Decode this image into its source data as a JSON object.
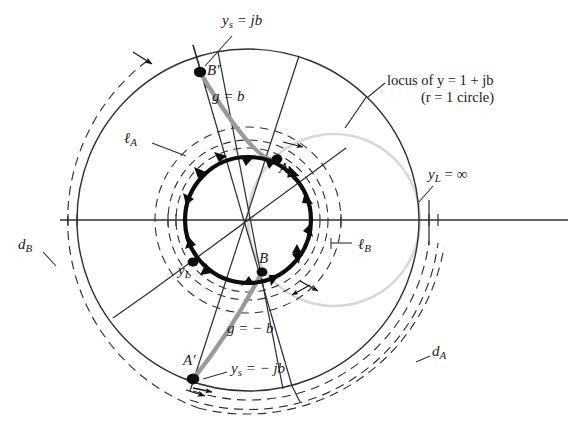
{
  "figure": {
    "type": "smith-chart-diagram",
    "background": "#ffffff",
    "ink": "#2b2b2b",
    "bold_ink": "#0d0d0d",
    "gray_trace": "#8c8c8c",
    "light_gray": "#d5d5d5"
  },
  "labels": {
    "ys_pos": {
      "text": "ys = jb",
      "main": "y",
      "sub": "s",
      "rest": " = jb",
      "x": 222,
      "y": 20
    },
    "ys_neg": {
      "text": "ys = − jb",
      "main": "y",
      "sub": "s",
      "rest": " = − jb",
      "x": 232,
      "y": 366
    },
    "b_prime": {
      "text": "B′",
      "x": 207,
      "y": 64
    },
    "a_prime": {
      "text": "A′",
      "x": 185,
      "y": 356
    },
    "point_a": {
      "text": "A",
      "x": 279,
      "y": 165
    },
    "point_b": {
      "text": "B",
      "x": 260,
      "y": 257
    },
    "g_eq_b": {
      "text": "g = b",
      "x": 212,
      "y": 90
    },
    "g_eq_neg_b": {
      "text": "g = − b",
      "x": 229,
      "y": 323
    },
    "ell_a": {
      "text": "ℓA",
      "main": "ℓ",
      "sub": "A",
      "x": 127,
      "y": 136
    },
    "ell_b": {
      "text": "ℓB",
      "main": "ℓ",
      "sub": "B",
      "x": 355,
      "y": 242
    },
    "d_a": {
      "text": "dA",
      "main": "d",
      "sub": "A",
      "x": 434,
      "y": 349
    },
    "d_b": {
      "text": "dB",
      "main": "d",
      "sub": "B",
      "x": 19,
      "y": 242
    },
    "y_l": {
      "text": "yL",
      "main": "y",
      "sub": "L",
      "x": 180,
      "y": 266
    },
    "y_l_inf": {
      "text": "yL = ∞",
      "main": "y",
      "sub": "L",
      "rest": " = ∞",
      "x": 430,
      "y": 172
    },
    "locus": {
      "line1": "locus of y = 1 + jb",
      "line2": "(r = 1  circle)",
      "x": 387,
      "y": 80
    }
  },
  "geometry": {
    "center": {
      "x": 248,
      "y": 220
    },
    "outer_solid_radius": 171,
    "dashed_da_radius": 181,
    "dashed_da2_radius": 190,
    "dashed_db_radius": 200,
    "bold_circle_radius": 63,
    "dashed_la_radius": 72,
    "dashed_la2_radius": 80,
    "dashed_lb_radius": 93,
    "r1_circle_radius": 86,
    "r1_circle_offset_x": 86
  },
  "markers": {
    "b_prime": {
      "x": 200,
      "y": 72
    },
    "a_prime": {
      "x": 193,
      "y": 379
    },
    "point_a": {
      "x": 277,
      "y": 159
    },
    "point_b": {
      "x": 262,
      "y": 272
    },
    "y_l": {
      "x": 193,
      "y": 262
    }
  },
  "annotations": {
    "arrow_direction": "clockwise",
    "arrowheads_on_bold_circle": 14,
    "leader_lines": [
      "locus-leader",
      "ell-a-leader",
      "ell-b-leader",
      "yl-inf-leader",
      "ys-pos-leader",
      "ys-neg-leader"
    ]
  }
}
